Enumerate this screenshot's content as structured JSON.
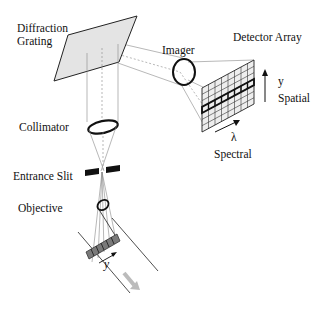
{
  "labels": {
    "grating": [
      "Diffraction",
      "Grating"
    ],
    "imager": "Imager",
    "detector": "Detector Array",
    "y_axis": "y",
    "spatial": "Spatial",
    "lambda": "λ",
    "spectral": "Spectral",
    "collimator": "Collimator",
    "slit": "Entrance Slit",
    "objective": "Objective",
    "sample_y": "y"
  },
  "colors": {
    "line": "#111111",
    "ray": "#888888",
    "grating_fill": "#e4e4e4",
    "detector_fill": "#eeeeee",
    "sample_fill": "#7a7a7a",
    "motion_arrow": "#bbbbbb"
  },
  "detector_grid": {
    "columns": 8,
    "rows": 7,
    "highlighted_row": 3
  }
}
